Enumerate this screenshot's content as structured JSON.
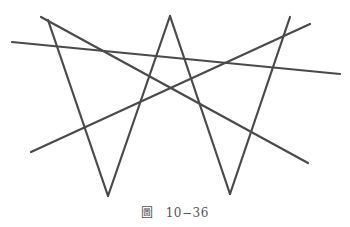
{
  "figure": {
    "stroke_color": "#4a4a4a",
    "stroke_width": 2.2,
    "segments": [
      {
        "id": "line-a",
        "x1": 12,
        "y1": 42,
        "x2": 340,
        "y2": 74
      },
      {
        "id": "line-b",
        "x1": 41,
        "y1": 17,
        "x2": 308,
        "y2": 163
      },
      {
        "id": "line-c",
        "x1": 48,
        "y1": 20,
        "x2": 108,
        "y2": 196
      },
      {
        "id": "line-d",
        "x1": 108,
        "y1": 196,
        "x2": 170,
        "y2": 16
      },
      {
        "id": "line-e",
        "x1": 170,
        "y1": 16,
        "x2": 230,
        "y2": 194
      },
      {
        "id": "line-f",
        "x1": 230,
        "y1": 194,
        "x2": 290,
        "y2": 17
      },
      {
        "id": "line-g",
        "x1": 31,
        "y1": 152,
        "x2": 310,
        "y2": 24
      }
    ]
  },
  "caption": {
    "label": "圖",
    "number": "10−36"
  }
}
